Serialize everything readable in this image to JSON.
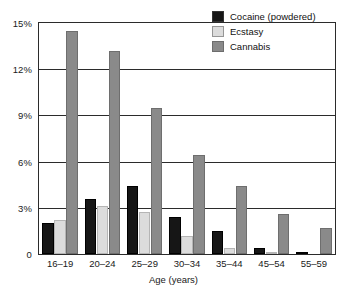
{
  "chart_data": {
    "type": "bar",
    "title": "",
    "xlabel": "Age (years)",
    "ylabel": "",
    "categories": [
      "16–19",
      "20–24",
      "25–29",
      "30–34",
      "35–44",
      "45–54",
      "55–59"
    ],
    "series": [
      {
        "name": "Cocaine (powdered)",
        "color": "#161616",
        "values": [
          2.0,
          3.6,
          4.4,
          2.4,
          1.5,
          0.4,
          0.1
        ]
      },
      {
        "name": "Ecstasy",
        "color": "#dcdcdc",
        "values": [
          2.2,
          3.15,
          2.7,
          1.2,
          0.4,
          0.15,
          0.0
        ]
      },
      {
        "name": "Cannabis",
        "color": "#8a8a8a",
        "values": [
          14.5,
          13.2,
          9.5,
          6.4,
          4.4,
          2.6,
          1.7
        ]
      }
    ],
    "ylim": [
      0,
      15
    ],
    "yticks": [
      0,
      3,
      6,
      9,
      12,
      15
    ],
    "ytick_labels": [
      "0",
      "3%",
      "6%",
      "9%",
      "12%",
      "15%"
    ],
    "grid": true,
    "legend_position": "top-right"
  },
  "legend": {
    "entries": [
      {
        "label": "Cocaine (powdered)",
        "color": "#161616"
      },
      {
        "label": "Ecstasy",
        "color": "#dcdcdc"
      },
      {
        "label": "Cannabis",
        "color": "#8a8a8a"
      }
    ]
  },
  "axis": {
    "x_title": "Age (years)"
  }
}
